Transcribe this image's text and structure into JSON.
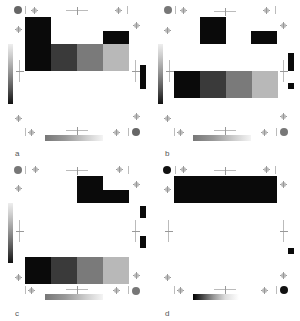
{
  "figure": {
    "panels": [
      {
        "label": "a",
        "corner_dot_color": "#666666",
        "blocks": [
          {
            "x": 25,
            "y": 17,
            "w": 26,
            "h": 54,
            "color": "#0a0a0a"
          },
          {
            "x": 51,
            "y": 44,
            "w": 26,
            "h": 27,
            "color": "#3a3a3a"
          },
          {
            "x": 77,
            "y": 44,
            "w": 26,
            "h": 27,
            "color": "#7a7a7a"
          },
          {
            "x": 103,
            "y": 44,
            "w": 26,
            "h": 27,
            "color": "#b8b8b8"
          },
          {
            "x": 103,
            "y": 31,
            "w": 26,
            "h": 13,
            "color": "#0a0a0a"
          }
        ],
        "side_marks": [
          {
            "x": 140,
            "y": 65,
            "w": 6,
            "h": 24
          }
        ]
      },
      {
        "label": "b",
        "corner_dot_color": "#777777",
        "blocks": [
          {
            "x": 50,
            "y": 17,
            "w": 26,
            "h": 27,
            "color": "#0a0a0a"
          },
          {
            "x": 101,
            "y": 31,
            "w": 26,
            "h": 13,
            "color": "#0a0a0a"
          },
          {
            "x": 24,
            "y": 71,
            "w": 26,
            "h": 27,
            "color": "#0a0a0a"
          },
          {
            "x": 50,
            "y": 71,
            "w": 26,
            "h": 27,
            "color": "#3a3a3a"
          },
          {
            "x": 76,
            "y": 71,
            "w": 26,
            "h": 27,
            "color": "#7a7a7a"
          },
          {
            "x": 102,
            "y": 71,
            "w": 26,
            "h": 27,
            "color": "#b8b8b8"
          }
        ],
        "side_marks": [
          {
            "x": 138,
            "y": 53,
            "w": 6,
            "h": 18
          },
          {
            "x": 138,
            "y": 83,
            "w": 6,
            "h": 6
          }
        ]
      },
      {
        "label": "c",
        "corner_dot_color": "#777777",
        "blocks": [
          {
            "x": 77,
            "y": 16,
            "w": 26,
            "h": 27,
            "color": "#0a0a0a"
          },
          {
            "x": 103,
            "y": 30,
            "w": 26,
            "h": 13,
            "color": "#0a0a0a"
          },
          {
            "x": 25,
            "y": 97,
            "w": 26,
            "h": 27,
            "color": "#0a0a0a"
          },
          {
            "x": 51,
            "y": 97,
            "w": 26,
            "h": 27,
            "color": "#3a3a3a"
          },
          {
            "x": 77,
            "y": 97,
            "w": 26,
            "h": 27,
            "color": "#7a7a7a"
          },
          {
            "x": 103,
            "y": 97,
            "w": 26,
            "h": 27,
            "color": "#b8b8b8"
          }
        ],
        "side_marks": [
          {
            "x": 140,
            "y": 46,
            "w": 6,
            "h": 12
          },
          {
            "x": 140,
            "y": 76,
            "w": 6,
            "h": 12
          }
        ]
      },
      {
        "label": "d",
        "corner_dot_color": "#111111",
        "blocks": [
          {
            "x": 24,
            "y": 16,
            "w": 103,
            "h": 27,
            "color": "#0a0a0a"
          }
        ],
        "side_marks": [
          {
            "x": 138,
            "y": 88,
            "w": 6,
            "h": 6
          }
        ]
      }
    ]
  }
}
